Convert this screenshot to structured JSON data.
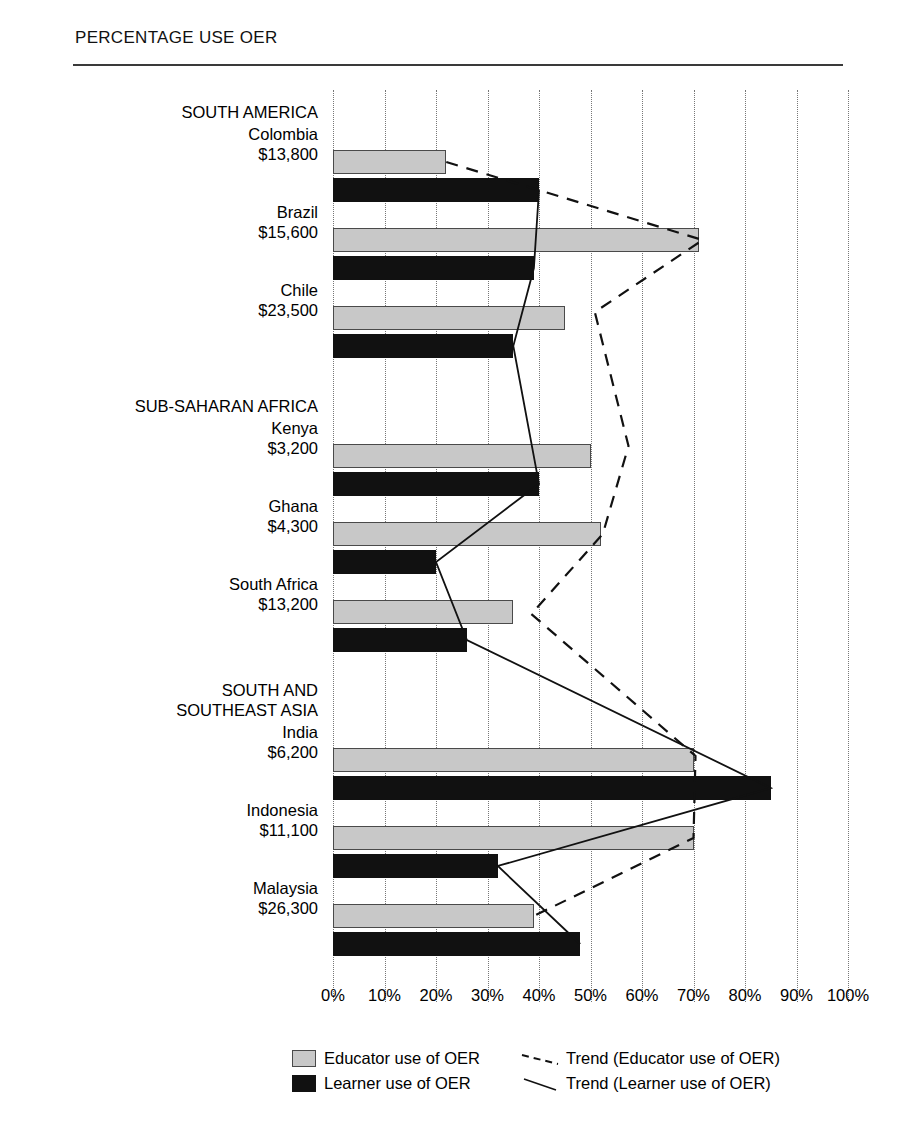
{
  "chart_data": {
    "type": "bar",
    "orientation": "horizontal",
    "title": "PERCENTAGE USE OER",
    "xlabel": "",
    "ylabel": "",
    "xlim": [
      0,
      100
    ],
    "xticks": [
      "0%",
      "10%",
      "20%",
      "30%",
      "40%",
      "50%",
      "60%",
      "70%",
      "80%",
      "90%",
      "100%"
    ],
    "xtick_values": [
      0,
      10,
      20,
      30,
      40,
      50,
      60,
      70,
      80,
      90,
      100
    ],
    "grid": true,
    "legend_position": "bottom",
    "groups": [
      {
        "name": "SOUTH AMERICA",
        "countries": [
          {
            "name": "Colombia",
            "gdp": "$13,800",
            "educator": 22,
            "learner": 40
          },
          {
            "name": "Brazil",
            "gdp": "$15,600",
            "educator": 71,
            "learner": 39
          },
          {
            "name": "Chile",
            "gdp": "$23,500",
            "educator": 45,
            "learner": 35
          }
        ]
      },
      {
        "name": "SUB-SAHARAN AFRICA",
        "countries": [
          {
            "name": "Kenya",
            "gdp": "$3,200",
            "educator": 50,
            "learner": 40
          },
          {
            "name": "Ghana",
            "gdp": "$4,300",
            "educator": 52,
            "learner": 20
          },
          {
            "name": "South Africa",
            "gdp": "$13,200",
            "educator": 35,
            "learner": 26
          }
        ]
      },
      {
        "name": "SOUTH AND\nSOUTHEAST ASIA",
        "countries": [
          {
            "name": "India",
            "gdp": "$6,200",
            "educator": 70,
            "learner": 85
          },
          {
            "name": "Indonesia",
            "gdp": "$11,100",
            "educator": 70,
            "learner": 32
          },
          {
            "name": "Malaysia",
            "gdp": "$26,300",
            "educator": 39,
            "learner": 48
          }
        ]
      }
    ],
    "series": [
      {
        "name": "Educator use of OER",
        "color": "#c8c8c8",
        "values": [
          22,
          71,
          45,
          50,
          52,
          35,
          70,
          70,
          39
        ]
      },
      {
        "name": "Learner use of OER",
        "color": "#111111",
        "values": [
          40,
          39,
          35,
          40,
          20,
          26,
          85,
          32,
          48
        ]
      }
    ],
    "trends": [
      {
        "name": "Trend (Educator use of OER)",
        "style": "dashed"
      },
      {
        "name": "Trend (Learner use of OER)",
        "style": "solid"
      }
    ]
  },
  "legend": {
    "educator_label": "Educator use of OER",
    "learner_label": "Learner use of OER",
    "educator_trend_label": "Trend (Educator use of OER)",
    "learner_trend_label": "Trend (Learner use of OER)"
  },
  "colors": {
    "educator": "#c8c8c8",
    "learner": "#111111",
    "grid": "#777777",
    "rule": "#3a3a3a"
  }
}
